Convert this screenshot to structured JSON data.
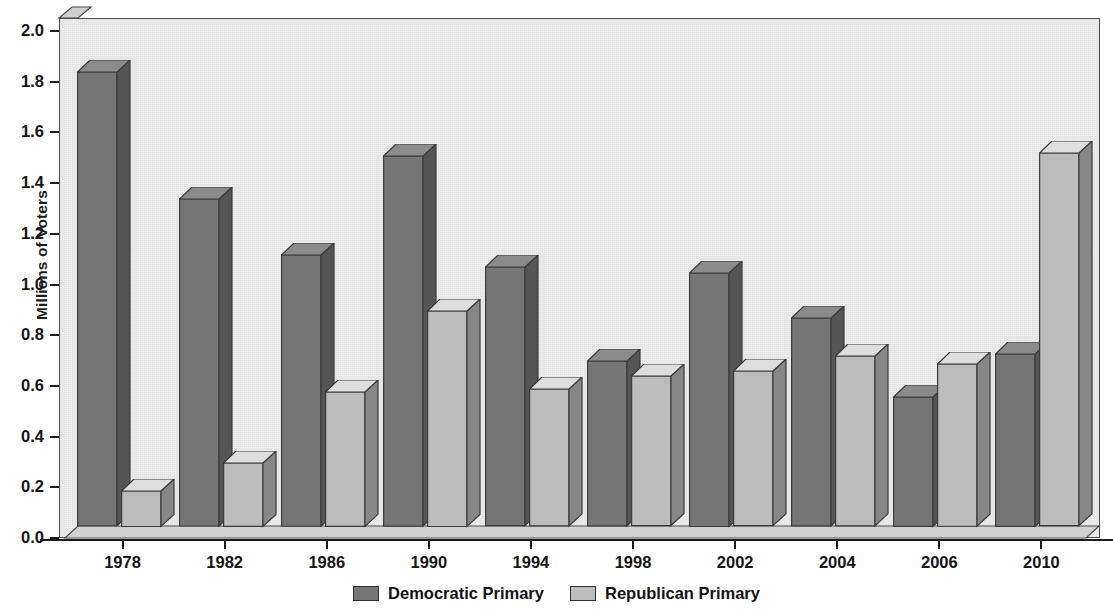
{
  "chart_data": {
    "type": "bar",
    "title": "",
    "subtitle": "",
    "xlabel": "",
    "ylabel": "Millions of Voters",
    "categories": [
      "1978",
      "1982",
      "1986",
      "1990",
      "1994",
      "1998",
      "2002",
      "2004",
      "2006",
      "2010"
    ],
    "series": [
      {
        "name": "Democratic Primary",
        "color": "#767676",
        "values": [
          1.79,
          1.29,
          1.07,
          1.46,
          1.02,
          0.65,
          1.0,
          0.82,
          0.51,
          0.68
        ]
      },
      {
        "name": "Republican Primary",
        "color": "#bcbcbc",
        "values": [
          0.14,
          0.25,
          0.53,
          0.85,
          0.54,
          0.59,
          0.61,
          0.67,
          0.64,
          1.47
        ]
      }
    ],
    "ylim": [
      0.0,
      2.0
    ],
    "ytick_step": 0.2,
    "ytick_labels": [
      "0.0",
      "0.2",
      "0.4",
      "0.6",
      "0.8",
      "1.0",
      "1.2",
      "1.4",
      "1.6",
      "1.8",
      "2.0"
    ],
    "grid": false,
    "legend_position": "bottom-center",
    "style": "3d-bars",
    "plot_background": "#ececec"
  },
  "axis": {
    "y_title": "Millions of Voters"
  },
  "legend": {
    "items": [
      {
        "label": "Democratic Primary",
        "swatch_color": "#767676"
      },
      {
        "label": "Republican Primary",
        "swatch_color": "#bcbcbc"
      }
    ]
  }
}
